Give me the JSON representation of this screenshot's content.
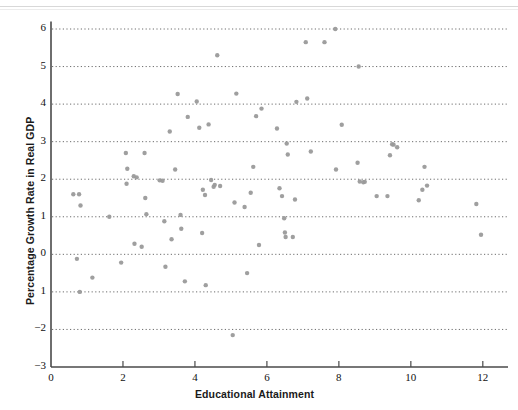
{
  "chart_data": {
    "type": "scatter",
    "title": "",
    "xlabel": "Educational Attainment",
    "ylabel": "Percentage Growth Rate in Real GDP",
    "xlim": [
      0,
      12.7
    ],
    "ylim": [
      -3,
      6.2
    ],
    "xticks": [
      0,
      2,
      4,
      6,
      8,
      10,
      12
    ],
    "xtick_labels": [
      "0",
      "2",
      "4",
      "6",
      "8",
      "10",
      "12"
    ],
    "yticks": [
      -3,
      -2,
      -1,
      0,
      1,
      2,
      3,
      4,
      5,
      6
    ],
    "ytick_labels": [
      "−3",
      "−2",
      "1",
      "0",
      "1",
      "2",
      "3",
      "4",
      "5",
      "6"
    ],
    "grid": {
      "horizontal": true,
      "vertical": false,
      "style": "dotted",
      "color": "#555555",
      "levels": [
        -2,
        -1,
        0,
        1,
        2,
        3,
        4,
        5,
        6
      ]
    },
    "legend": null,
    "marker": {
      "shape": "circle",
      "color": "#9a9a9a",
      "size_px": 4.4,
      "opacity": 0.95
    },
    "axis_color": "#4a4a4a",
    "points": [
      [
        0.62,
        1.6
      ],
      [
        0.78,
        1.6
      ],
      [
        0.72,
        -0.12
      ],
      [
        0.82,
        1.3
      ],
      [
        0.8,
        -1.0
      ],
      [
        1.15,
        -0.62
      ],
      [
        1.62,
        1.0
      ],
      [
        1.95,
        -0.22
      ],
      [
        2.08,
        2.7
      ],
      [
        2.12,
        2.28
      ],
      [
        2.1,
        1.88
      ],
      [
        2.3,
        2.08
      ],
      [
        2.38,
        2.05
      ],
      [
        2.32,
        0.28
      ],
      [
        2.52,
        0.2
      ],
      [
        2.6,
        2.7
      ],
      [
        2.62,
        1.5
      ],
      [
        2.65,
        1.07
      ],
      [
        3.02,
        1.97
      ],
      [
        3.1,
        1.96
      ],
      [
        3.15,
        0.88
      ],
      [
        3.18,
        -0.33
      ],
      [
        3.3,
        3.27
      ],
      [
        3.35,
        0.4
      ],
      [
        3.45,
        2.26
      ],
      [
        3.52,
        4.27
      ],
      [
        3.6,
        1.05
      ],
      [
        3.62,
        0.68
      ],
      [
        3.72,
        -0.72
      ],
      [
        3.8,
        3.66
      ],
      [
        4.05,
        4.07
      ],
      [
        4.12,
        3.37
      ],
      [
        4.22,
        1.72
      ],
      [
        4.2,
        0.57
      ],
      [
        4.28,
        1.58
      ],
      [
        4.3,
        -0.82
      ],
      [
        4.38,
        3.46
      ],
      [
        4.45,
        1.98
      ],
      [
        4.52,
        1.8
      ],
      [
        4.55,
        1.85
      ],
      [
        4.62,
        5.3
      ],
      [
        4.7,
        1.82
      ],
      [
        5.05,
        -2.15
      ],
      [
        5.1,
        1.38
      ],
      [
        5.15,
        4.28
      ],
      [
        5.38,
        1.26
      ],
      [
        5.45,
        -0.5
      ],
      [
        5.55,
        1.64
      ],
      [
        5.62,
        2.33
      ],
      [
        5.7,
        3.68
      ],
      [
        5.78,
        0.25
      ],
      [
        5.85,
        3.88
      ],
      [
        6.28,
        3.35
      ],
      [
        6.35,
        1.76
      ],
      [
        6.42,
        1.55
      ],
      [
        6.48,
        0.96
      ],
      [
        6.5,
        0.58
      ],
      [
        6.52,
        0.46
      ],
      [
        6.55,
        2.95
      ],
      [
        6.58,
        2.66
      ],
      [
        6.72,
        0.46
      ],
      [
        6.78,
        1.46
      ],
      [
        6.82,
        4.06
      ],
      [
        7.08,
        5.65
      ],
      [
        7.12,
        4.15
      ],
      [
        7.22,
        2.74
      ],
      [
        7.6,
        5.65
      ],
      [
        7.9,
        6.0
      ],
      [
        7.92,
        2.26
      ],
      [
        8.08,
        3.45
      ],
      [
        8.52,
        2.44
      ],
      [
        8.55,
        5.0
      ],
      [
        8.58,
        1.94
      ],
      [
        8.68,
        1.92
      ],
      [
        8.72,
        1.93
      ],
      [
        9.05,
        1.55
      ],
      [
        9.35,
        1.55
      ],
      [
        9.42,
        2.64
      ],
      [
        9.48,
        2.93
      ],
      [
        9.52,
        2.92
      ],
      [
        9.62,
        2.85
      ],
      [
        10.22,
        1.44
      ],
      [
        10.32,
        1.72
      ],
      [
        10.38,
        2.33
      ],
      [
        10.45,
        1.83
      ],
      [
        11.82,
        1.34
      ],
      [
        11.95,
        0.52
      ]
    ]
  }
}
